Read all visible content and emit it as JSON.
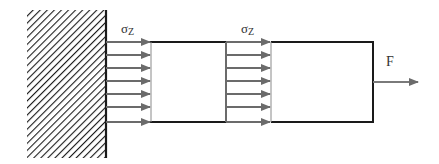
{
  "diagram": {
    "type": "free-body / stress diagram",
    "wall": {
      "label": "fixed-support",
      "hatched": true
    },
    "bar": {
      "label": "bar-under-tension"
    },
    "stress_labels": [
      {
        "symbol": "σ",
        "subscript": "Z",
        "x": 121,
        "y": 22
      },
      {
        "symbol": "σ",
        "subscript": "Z",
        "x": 241,
        "y": 22
      }
    ],
    "force": {
      "label": "F",
      "direction": "right"
    },
    "stress_arrow_count_per_section": 7,
    "colors": {
      "outline": "#1a1a1a",
      "arrow": "#6b6b6b",
      "hatch": "#1a1a1a",
      "text": "#333333"
    }
  }
}
